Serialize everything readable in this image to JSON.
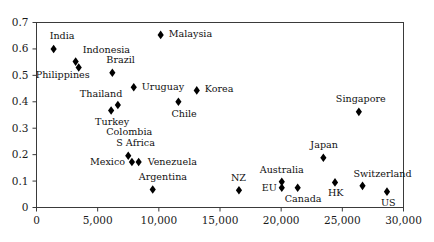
{
  "chart_data": {
    "type": "scatter",
    "title": "",
    "subtitle": "",
    "xlabel": "",
    "ylabel": "",
    "xlim": [
      0,
      30000
    ],
    "ylim": [
      0,
      0.7
    ],
    "grid": false,
    "legend": "none",
    "marker": "filled-diamond",
    "marker_color": "#000000",
    "xticks": [
      0,
      5000,
      10000,
      15000,
      20000,
      25000,
      30000
    ],
    "xtick_labels": [
      "0",
      "5,000",
      "10,000",
      "15,000",
      "20,000",
      "25,000",
      "30,000"
    ],
    "yticks": [
      0,
      0.1,
      0.2,
      0.3,
      0.4,
      0.5,
      0.6,
      0.7
    ],
    "ytick_labels": [
      "0",
      "0.1",
      "0.2",
      "0.3",
      "0.4",
      "0.5",
      "0.6",
      "0.7"
    ],
    "points": [
      {
        "label": "India",
        "x": 1400,
        "y": 0.6,
        "label_dx": -4,
        "label_dy": -14,
        "align": "left"
      },
      {
        "label": "Indonesia",
        "x": 3200,
        "y": 0.552,
        "label_dx": 7,
        "label_dy": -13,
        "align": "left"
      },
      {
        "label": "Philippines",
        "x": 3450,
        "y": 0.53,
        "label_dx": -43,
        "label_dy": 7,
        "align": "left"
      },
      {
        "label": "Brazil",
        "x": 6200,
        "y": 0.51,
        "label_dx": -6,
        "label_dy": -14,
        "align": "left"
      },
      {
        "label": "Uruguay",
        "x": 7950,
        "y": 0.455,
        "label_dx": 8,
        "label_dy": -1,
        "align": "left"
      },
      {
        "label": "Thailand",
        "x": 6650,
        "y": 0.388,
        "label_dx": -38,
        "label_dy": -12,
        "align": "left"
      },
      {
        "label": "Turkey",
        "x": 6100,
        "y": 0.367,
        "label_dx": -16,
        "label_dy": 10,
        "align": "left"
      },
      {
        "label": "Malaysia",
        "x": 10150,
        "y": 0.653,
        "label_dx": 8,
        "label_dy": -2,
        "align": "left"
      },
      {
        "label": "Chile",
        "x": 11600,
        "y": 0.4,
        "label_dx": -7,
        "label_dy": 11,
        "align": "left"
      },
      {
        "label": "Korea",
        "x": 13100,
        "y": 0.443,
        "label_dx": 8,
        "label_dy": -2,
        "align": "left"
      },
      {
        "label": "Colombia",
        "x": 7500,
        "y": 0.196,
        "label_dx": -22,
        "label_dy": -25,
        "align": "left"
      },
      {
        "label": "S Africa",
        "x": 7500,
        "y": 0.196,
        "label_dx": -12,
        "label_dy": -14,
        "align": "left"
      },
      {
        "label": "Mexico",
        "x": 7800,
        "y": 0.172,
        "label_dx": -42,
        "label_dy": -1,
        "align": "left"
      },
      {
        "label": "Venezuela",
        "x": 8350,
        "y": 0.172,
        "label_dx": 9,
        "label_dy": -1,
        "align": "left"
      },
      {
        "label": "Argentina",
        "x": 9500,
        "y": 0.068,
        "label_dx": -14,
        "label_dy": -14,
        "align": "left"
      },
      {
        "label": "NZ",
        "x": 16550,
        "y": 0.065,
        "label_dx": -8,
        "label_dy": -13,
        "align": "left"
      },
      {
        "label": "Australia",
        "x": 20050,
        "y": 0.097,
        "label_dx": -22,
        "label_dy": -13,
        "align": "left"
      },
      {
        "label": "EU",
        "x": 20050,
        "y": 0.075,
        "label_dx": -20,
        "label_dy": -1,
        "align": "left"
      },
      {
        "label": "Canada",
        "x": 21350,
        "y": 0.075,
        "label_dx": -13,
        "label_dy": 10,
        "align": "left"
      },
      {
        "label": "Japan",
        "x": 23450,
        "y": 0.188,
        "label_dx": -13,
        "label_dy": -14,
        "align": "left"
      },
      {
        "label": "HK",
        "x": 24400,
        "y": 0.095,
        "label_dx": -7,
        "label_dy": 10,
        "align": "left"
      },
      {
        "label": "Switzerland",
        "x": 26650,
        "y": 0.082,
        "label_dx": -9,
        "label_dy": -13,
        "align": "left"
      },
      {
        "label": "US",
        "x": 28650,
        "y": 0.06,
        "label_dx": -6,
        "label_dy": 10,
        "align": "left"
      },
      {
        "label": "Singapore",
        "x": 26350,
        "y": 0.362,
        "label_dx": -23,
        "label_dy": -14,
        "align": "left"
      }
    ]
  }
}
